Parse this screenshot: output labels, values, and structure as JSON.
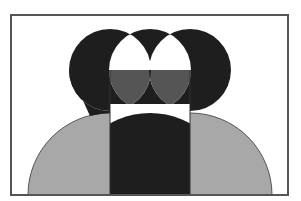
{
  "figure": {
    "colors": {
      "background": "#ffffff",
      "frame": "#555555",
      "black": "#1e1e1e",
      "dark_gray": "#555555",
      "light_gray": "#a8a8a8",
      "white": "#ffffff"
    }
  }
}
